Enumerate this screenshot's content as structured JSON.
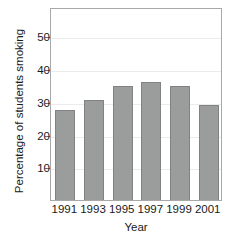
{
  "chart_data": {
    "type": "bar",
    "title": "",
    "xlabel": "Year",
    "ylabel": "Percentage of students smoking",
    "categories": [
      "1991",
      "1993",
      "1995",
      "1997",
      "1999",
      "2001"
    ],
    "values": [
      27.5,
      30.5,
      35,
      36,
      35,
      29
    ],
    "yticks": [
      10,
      20,
      30,
      40,
      50
    ],
    "ytick_labels": [
      "10",
      "20",
      "30",
      "40",
      "50"
    ],
    "ylim": [
      0,
      59
    ],
    "grid": "horizontal",
    "legend": "none",
    "series": [
      {
        "name": "Percentage of students smoking",
        "values": [
          27.5,
          30.5,
          35,
          36,
          35,
          29
        ]
      }
    ],
    "colors": {
      "bar_fill": "#9b9c9c",
      "bar_border": "#818283",
      "frame": "#a8a8a8",
      "gridline": "#eceaea",
      "text": "#1a1a1a"
    }
  }
}
